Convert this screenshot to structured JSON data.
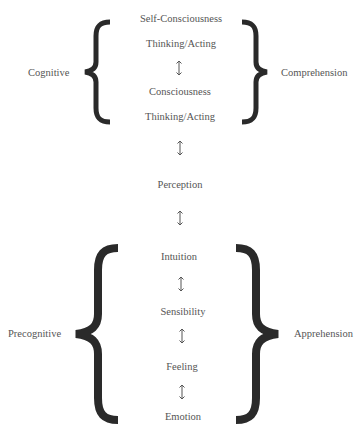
{
  "diagram": {
    "upper_group": {
      "left_label": "Cognitive",
      "right_label": "Comprehension",
      "items": [
        "Self-Consciousness",
        "Thinking/Acting",
        "Consciousness",
        "Thinking/Acting"
      ]
    },
    "middle": {
      "item": "Perception"
    },
    "lower_group": {
      "left_label": "Precognitive",
      "right_label": "Apprehension",
      "items": [
        "Intuition",
        "Sensibility",
        "Feeling",
        "Emotion"
      ]
    },
    "connector_icon": "up-down-arrow",
    "colors": {
      "text": "#555555",
      "brace": "#2a2a2a",
      "arrow": "#555555",
      "background": "#ffffff"
    }
  }
}
